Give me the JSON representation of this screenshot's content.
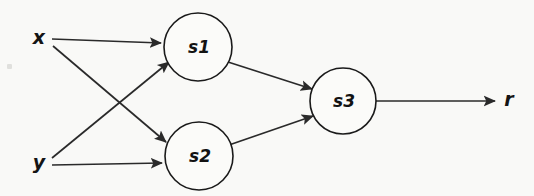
{
  "diagram": {
    "type": "directed-graph",
    "background_color": "#f9f9f7",
    "stroke_color": "#2a2a2a",
    "nodes": [
      {
        "id": "s1",
        "label": "s1",
        "cx": 198,
        "cy": 47,
        "r": 34
      },
      {
        "id": "s2",
        "label": "s2",
        "cx": 199,
        "cy": 156,
        "r": 34
      },
      {
        "id": "s3",
        "label": "s3",
        "cx": 343,
        "cy": 101,
        "r": 33
      }
    ],
    "inputs": [
      {
        "id": "x",
        "label": "x",
        "x": 39,
        "y": 39
      },
      {
        "id": "y",
        "label": "y",
        "x": 39,
        "y": 163
      }
    ],
    "outputs": [
      {
        "id": "r",
        "label": "r",
        "x": 509,
        "y": 100
      }
    ],
    "edges": [
      {
        "from": "x",
        "to": "s1",
        "x1": 52,
        "y1": 39,
        "x2": 163,
        "y2": 44
      },
      {
        "from": "x",
        "to": "s2",
        "x1": 52,
        "y1": 45,
        "x2": 167,
        "y2": 143
      },
      {
        "from": "y",
        "to": "s1",
        "x1": 52,
        "y1": 158,
        "x2": 170,
        "y2": 62
      },
      {
        "from": "y",
        "to": "s2",
        "x1": 52,
        "y1": 165,
        "x2": 164,
        "y2": 163
      },
      {
        "from": "s1",
        "to": "s3",
        "x1": 228,
        "y1": 62,
        "x2": 313,
        "y2": 89
      },
      {
        "from": "s2",
        "to": "s3",
        "x1": 229,
        "y1": 144,
        "x2": 314,
        "y2": 116
      },
      {
        "from": "s3",
        "to": "r",
        "x1": 376,
        "y1": 101,
        "x2": 497,
        "y2": 101
      }
    ]
  }
}
